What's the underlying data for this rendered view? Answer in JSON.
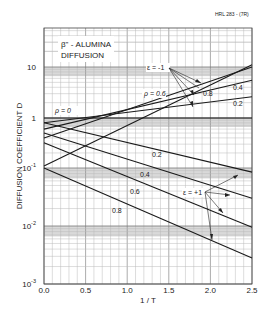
{
  "figure_id": "HRL 283 - (7R)",
  "chart_data": {
    "type": "line",
    "title": "β\" - ALUMINA DIFFUSION",
    "title_line1": "β\" - ALUMINA",
    "title_line2": "DIFFUSION",
    "xlabel": "1 / T",
    "ylabel": "DIFFUSION COEFFICIENT D",
    "xlim": [
      0.0,
      2.5
    ],
    "ylim": [
      0.001,
      30
    ],
    "yscale": "log",
    "grid": true,
    "x_ticks": [
      "0.0",
      "0.5",
      "1.0",
      "1.5",
      "2.0",
      "2.5"
    ],
    "y_ticks": [
      {
        "value": 10,
        "label": "10"
      },
      {
        "value": 1,
        "label": "1"
      },
      {
        "value": 0.1,
        "label": "10-1"
      },
      {
        "value": 0.01,
        "label": "10-2"
      },
      {
        "value": 0.001,
        "label": "10-3"
      }
    ],
    "series": [
      {
        "name": "ε=-1, ρ=0",
        "group": "epsilon=-1",
        "rho": 0,
        "x": [
          0.0,
          2.5
        ],
        "y": [
          1.0,
          1.0
        ]
      },
      {
        "name": "ε=-1, ρ=0.2",
        "group": "epsilon=-1",
        "rho": 0.2,
        "x": [
          0.0,
          2.5
        ],
        "y": [
          0.8,
          2.6
        ]
      },
      {
        "name": "ε=-1, ρ=0.4",
        "group": "epsilon=-1",
        "rho": 0.4,
        "x": [
          0.0,
          2.5
        ],
        "y": [
          0.6,
          5.5
        ]
      },
      {
        "name": "ε=-1, ρ=0.6",
        "group": "epsilon=-1",
        "rho": 0.6,
        "x": [
          0.0,
          2.5
        ],
        "y": [
          0.4,
          10.0
        ]
      },
      {
        "name": "ε=-1, ρ=0.8",
        "group": "epsilon=-1",
        "rho": 0.8,
        "x": [
          0.0,
          2.5
        ],
        "y": [
          0.11,
          11.0
        ]
      },
      {
        "name": "ε=+1, ρ=0.2",
        "group": "epsilon=+1",
        "rho": 0.2,
        "x": [
          0.0,
          2.5
        ],
        "y": [
          0.8,
          0.085
        ]
      },
      {
        "name": "ε=+1, ρ=0.4",
        "group": "epsilon=+1",
        "rho": 0.4,
        "x": [
          0.0,
          2.5
        ],
        "y": [
          0.5,
          0.03
        ]
      },
      {
        "name": "ε=+1, ρ=0.6",
        "group": "epsilon=+1",
        "rho": 0.6,
        "x": [
          0.0,
          2.5
        ],
        "y": [
          0.32,
          0.0095
        ]
      },
      {
        "name": "ε=+1, ρ=0.8",
        "group": "epsilon=+1",
        "rho": 0.8,
        "x": [
          0.0,
          2.5
        ],
        "y": [
          0.1,
          0.0028
        ]
      }
    ],
    "annotations": [
      {
        "text": "ε = -1",
        "target": "rising curves"
      },
      {
        "text": "ε = +1",
        "target": "falling curves"
      },
      {
        "text": "ρ = 0"
      },
      {
        "text": "ρ = 0.6"
      },
      {
        "text": "0.8"
      },
      {
        "text": "0.4"
      },
      {
        "text": "0.2"
      },
      {
        "text": "0.2"
      },
      {
        "text": "0.4"
      },
      {
        "text": "0.6"
      },
      {
        "text": "0.8"
      }
    ]
  },
  "labels": {
    "eps_minus": "ε = -1",
    "eps_plus": "ε = +1",
    "rho0": "ρ = 0",
    "rho06": "ρ = 0.6",
    "m08": "0.8",
    "m04": "0.4",
    "m02": "0.2",
    "p02": "0.2",
    "p04": "0.4",
    "p06": "0.6",
    "p08": "0.8"
  }
}
